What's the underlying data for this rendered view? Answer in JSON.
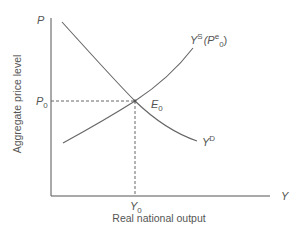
{
  "diagram": {
    "type": "aggregate supply-demand equilibrium",
    "y_axis": {
      "symbol": "P",
      "label": "Aggregate price level"
    },
    "x_axis": {
      "symbol": "Y",
      "label": "Real national output"
    },
    "equilibrium": {
      "label": "E",
      "sub": "0",
      "price": {
        "label": "P",
        "sub": "0"
      },
      "output": {
        "label": "Y",
        "sub": "0"
      }
    },
    "curves": [
      {
        "name": "aggregate-demand",
        "label": "Y",
        "sup": "D",
        "slope": "downward"
      },
      {
        "name": "aggregate-supply",
        "label": "Y",
        "sup": "S",
        "arg_open": "(P",
        "arg_sup": "e",
        "arg_sub": "0",
        "arg_close": ")",
        "slope": "upward"
      }
    ],
    "colors": {
      "axis": "#555555",
      "curve": "#666666",
      "text": "#555555"
    }
  }
}
